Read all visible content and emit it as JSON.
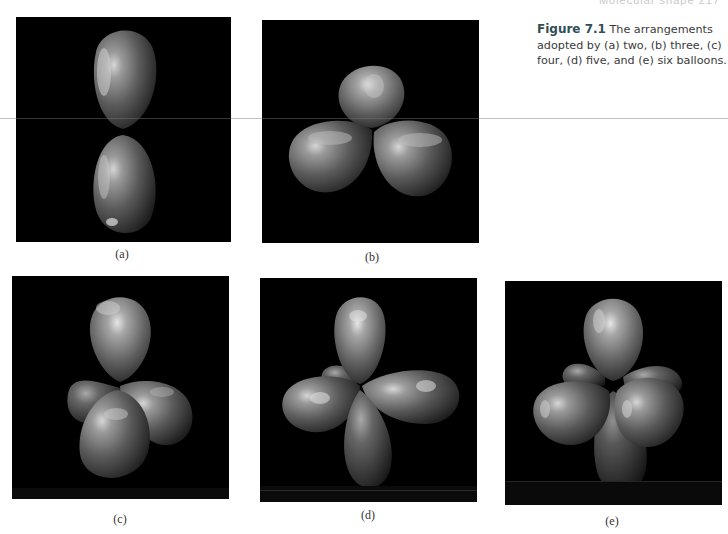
{
  "page": {
    "running_head": "Molecular shape   217"
  },
  "figure": {
    "number": "Figure 7.1",
    "caption_text": " The arrangements adopted by (a) two, (b) three, (c) four, (d) five, and (e) six balloons.",
    "panels": [
      {
        "id": "a",
        "label": "(a)",
        "balloons": 2,
        "description": "two balloons, linear arrangement"
      },
      {
        "id": "b",
        "label": "(b)",
        "balloons": 3,
        "description": "three balloons, trigonal planar arrangement"
      },
      {
        "id": "c",
        "label": "(c)",
        "balloons": 4,
        "description": "four balloons, tetrahedral arrangement"
      },
      {
        "id": "d",
        "label": "(d)",
        "balloons": 5,
        "description": "five balloons, trigonal bipyramidal arrangement"
      },
      {
        "id": "e",
        "label": "(e)",
        "balloons": 6,
        "description": "six balloons, octahedral arrangement"
      }
    ]
  },
  "colors": {
    "panel_background": "#000000",
    "balloon_highlight": "#d8d8d8",
    "balloon_mid": "#6e6e6e",
    "balloon_shadow": "#1c1c1c",
    "caption_figure_number": "#2f4f56",
    "caption_text": "#3a3a3a"
  }
}
